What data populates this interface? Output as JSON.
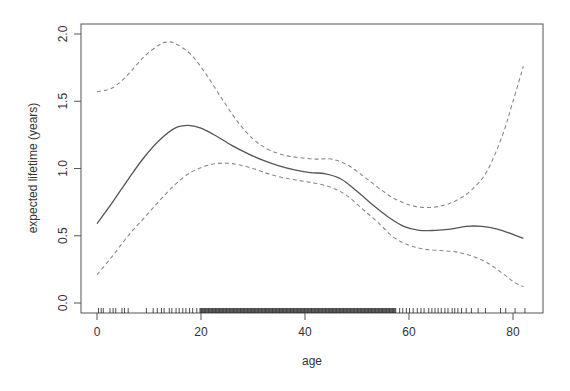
{
  "chart_data": {
    "type": "line",
    "title": "",
    "xlabel": "age",
    "ylabel": "expected lifetime (years)",
    "xlim": [
      -3,
      85
    ],
    "ylim": [
      -0.03,
      2.07
    ],
    "x_ticks": [
      0,
      20,
      40,
      60,
      80
    ],
    "x_tick_labels": [
      "0",
      "20",
      "40",
      "60",
      "80"
    ],
    "y_ticks": [
      0.0,
      0.5,
      1.0,
      1.5,
      2.0
    ],
    "y_tick_labels": [
      "0.0",
      "0.5",
      "1.0",
      "1.5",
      "2.0"
    ],
    "grid": false,
    "legend": "none",
    "series": [
      {
        "name": "fit",
        "style": "solid",
        "color": "#555555",
        "x": [
          0,
          3,
          6,
          9,
          12,
          15,
          17.5,
          20,
          23,
          26,
          29,
          32,
          35,
          38,
          41,
          44,
          47,
          50,
          53,
          56,
          59,
          62,
          65,
          68,
          71,
          74,
          77,
          80,
          82
        ],
        "y": [
          0.59,
          0.75,
          0.92,
          1.08,
          1.21,
          1.3,
          1.32,
          1.3,
          1.24,
          1.17,
          1.11,
          1.06,
          1.02,
          0.99,
          0.97,
          0.96,
          0.92,
          0.83,
          0.73,
          0.64,
          0.57,
          0.54,
          0.54,
          0.55,
          0.57,
          0.57,
          0.55,
          0.51,
          0.48
        ]
      },
      {
        "name": "upper confidence band",
        "style": "dashed",
        "color": "#888888",
        "x": [
          0,
          3,
          6,
          9,
          12,
          13.5,
          15,
          18,
          21,
          24,
          27,
          30,
          33,
          36,
          39,
          42,
          45,
          48,
          51,
          54,
          57,
          60,
          63,
          66,
          69,
          72,
          75,
          78,
          80,
          82
        ],
        "y": [
          1.57,
          1.6,
          1.7,
          1.83,
          1.92,
          1.94,
          1.93,
          1.85,
          1.7,
          1.52,
          1.35,
          1.22,
          1.14,
          1.1,
          1.08,
          1.07,
          1.07,
          1.03,
          0.95,
          0.86,
          0.78,
          0.73,
          0.71,
          0.72,
          0.76,
          0.84,
          0.98,
          1.25,
          1.5,
          1.76
        ]
      },
      {
        "name": "lower confidence band",
        "style": "dashed",
        "color": "#888888",
        "x": [
          0,
          3,
          6,
          9,
          12,
          15,
          18,
          21,
          24,
          27,
          30,
          33,
          36,
          39,
          42,
          45,
          48,
          51,
          54,
          57,
          60,
          63,
          66,
          69,
          72,
          75,
          78,
          80,
          82
        ],
        "y": [
          0.21,
          0.35,
          0.5,
          0.63,
          0.76,
          0.88,
          0.97,
          1.02,
          1.04,
          1.03,
          1.0,
          0.96,
          0.93,
          0.91,
          0.89,
          0.86,
          0.8,
          0.7,
          0.6,
          0.49,
          0.43,
          0.4,
          0.39,
          0.38,
          0.35,
          0.3,
          0.22,
          0.16,
          0.12
        ]
      }
    ],
    "rug": {
      "description": "rug of observed ages along x-axis",
      "sparse_left": [
        0.3,
        0.8,
        1.2,
        2.5,
        3.1,
        3.6,
        4.8,
        5.3,
        6.0,
        9.5,
        10.8,
        11.6,
        12.4,
        12.9,
        13.9,
        14.4,
        15.2,
        15.8,
        16.5,
        17.1,
        17.8,
        18.4,
        19.2
      ],
      "dense_range": [
        19.8,
        57.5
      ],
      "sparse_right": [
        58.2,
        58.8,
        59.5,
        60.1,
        60.8,
        61.6,
        62.3,
        62.9,
        63.8,
        64.4,
        65.0,
        65.6,
        66.2,
        66.9,
        67.5,
        68.3,
        68.8,
        69.4,
        70.1,
        71.0,
        72.0,
        73.3,
        74.7,
        77.6,
        78.6,
        80.4,
        82.3
      ]
    }
  }
}
